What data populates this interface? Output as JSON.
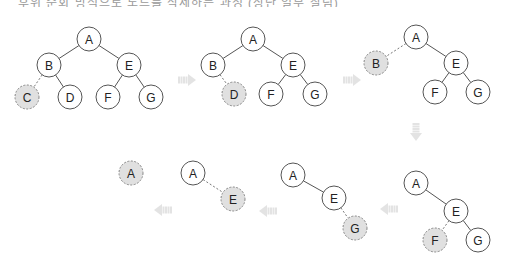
{
  "caption": "후위 순회 방식으로 노드를 삭제하는 과정 (상단 일부 잘림)",
  "colors": {
    "node_fill": "#ffffff",
    "node_stroke": "#555555",
    "removed_fill": "#e0e0e0",
    "arrow_fill": "#e3e3e3"
  },
  "panels": [
    {
      "id": "step1",
      "nodes": [
        {
          "label": "A",
          "x": 89,
          "y": 39,
          "removed": false
        },
        {
          "label": "B",
          "x": 49,
          "y": 65,
          "removed": false
        },
        {
          "label": "E",
          "x": 129,
          "y": 65,
          "removed": false
        },
        {
          "label": "C",
          "x": 27,
          "y": 97,
          "removed": true
        },
        {
          "label": "D",
          "x": 70,
          "y": 97,
          "removed": false
        },
        {
          "label": "F",
          "x": 108,
          "y": 97,
          "removed": false
        },
        {
          "label": "G",
          "x": 151,
          "y": 97,
          "removed": false
        }
      ],
      "edges": [
        {
          "from": "A",
          "to": "B",
          "dashed": false
        },
        {
          "from": "A",
          "to": "E",
          "dashed": false
        },
        {
          "from": "B",
          "to": "C",
          "dashed": true
        },
        {
          "from": "B",
          "to": "D",
          "dashed": false
        },
        {
          "from": "E",
          "to": "F",
          "dashed": false
        },
        {
          "from": "E",
          "to": "G",
          "dashed": false
        }
      ]
    },
    {
      "id": "step2",
      "nodes": [
        {
          "label": "A",
          "x": 253,
          "y": 39,
          "removed": false
        },
        {
          "label": "B",
          "x": 213,
          "y": 65,
          "removed": false
        },
        {
          "label": "E",
          "x": 293,
          "y": 65,
          "removed": false
        },
        {
          "label": "D",
          "x": 234,
          "y": 94,
          "removed": true
        },
        {
          "label": "F",
          "x": 271,
          "y": 94,
          "removed": false
        },
        {
          "label": "G",
          "x": 315,
          "y": 94,
          "removed": false
        }
      ],
      "edges": [
        {
          "from": "A",
          "to": "B",
          "dashed": false
        },
        {
          "from": "A",
          "to": "E",
          "dashed": false
        },
        {
          "from": "B",
          "to": "D",
          "dashed": true
        },
        {
          "from": "E",
          "to": "F",
          "dashed": false
        },
        {
          "from": "E",
          "to": "G",
          "dashed": false
        }
      ]
    },
    {
      "id": "step3",
      "nodes": [
        {
          "label": "A",
          "x": 416,
          "y": 37,
          "removed": false
        },
        {
          "label": "B",
          "x": 376,
          "y": 63,
          "removed": true
        },
        {
          "label": "E",
          "x": 456,
          "y": 63,
          "removed": false
        },
        {
          "label": "F",
          "x": 435,
          "y": 92,
          "removed": false
        },
        {
          "label": "G",
          "x": 478,
          "y": 92,
          "removed": false
        }
      ],
      "edges": [
        {
          "from": "A",
          "to": "B",
          "dashed": true
        },
        {
          "from": "A",
          "to": "E",
          "dashed": false
        },
        {
          "from": "E",
          "to": "F",
          "dashed": false
        },
        {
          "from": "E",
          "to": "G",
          "dashed": false
        }
      ]
    },
    {
      "id": "step4",
      "nodes": [
        {
          "label": "A",
          "x": 416,
          "y": 183,
          "removed": false
        },
        {
          "label": "E",
          "x": 456,
          "y": 211,
          "removed": false
        },
        {
          "label": "F",
          "x": 435,
          "y": 240,
          "removed": true
        },
        {
          "label": "G",
          "x": 478,
          "y": 240,
          "removed": false
        }
      ],
      "edges": [
        {
          "from": "A",
          "to": "E",
          "dashed": false
        },
        {
          "from": "E",
          "to": "F",
          "dashed": true
        },
        {
          "from": "E",
          "to": "G",
          "dashed": false
        }
      ]
    },
    {
      "id": "step5",
      "nodes": [
        {
          "label": "A",
          "x": 293,
          "y": 175,
          "removed": false
        },
        {
          "label": "E",
          "x": 334,
          "y": 198,
          "removed": false
        },
        {
          "label": "G",
          "x": 355,
          "y": 228,
          "removed": true
        }
      ],
      "edges": [
        {
          "from": "A",
          "to": "E",
          "dashed": false
        },
        {
          "from": "E",
          "to": "G",
          "dashed": true
        }
      ]
    },
    {
      "id": "step6",
      "nodes": [
        {
          "label": "A",
          "x": 193,
          "y": 173,
          "removed": false
        },
        {
          "label": "E",
          "x": 233,
          "y": 199,
          "removed": true
        }
      ],
      "edges": [
        {
          "from": "A",
          "to": "E",
          "dashed": true
        }
      ]
    },
    {
      "id": "step7",
      "nodes": [
        {
          "label": "A",
          "x": 131,
          "y": 173,
          "removed": true
        }
      ],
      "edges": []
    }
  ],
  "arrows": [
    {
      "direction": "right",
      "x": 187,
      "y": 80
    },
    {
      "direction": "right",
      "x": 352,
      "y": 80
    },
    {
      "direction": "down",
      "x": 416,
      "y": 132
    },
    {
      "direction": "left",
      "x": 389,
      "y": 209
    },
    {
      "direction": "left",
      "x": 268,
      "y": 211
    },
    {
      "direction": "left",
      "x": 163,
      "y": 210
    }
  ]
}
